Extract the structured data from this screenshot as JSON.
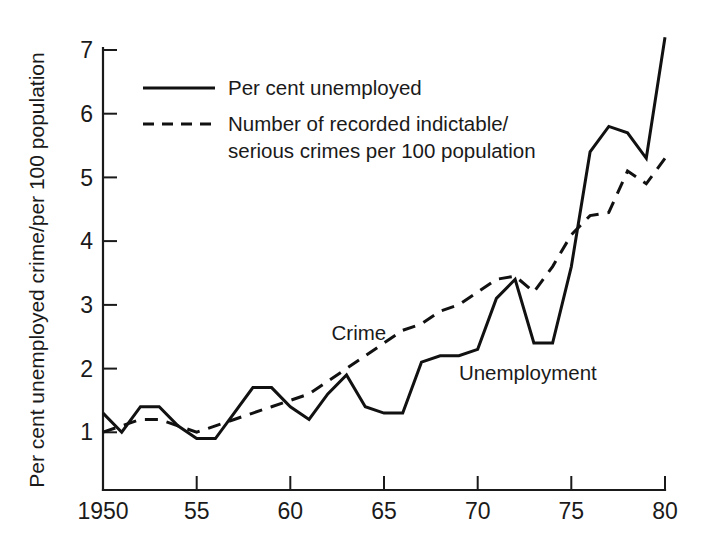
{
  "chart_data": {
    "type": "line",
    "title": "",
    "subtitle": "",
    "xlabel": "",
    "ylabel": "Per cent unemployed crime/per 100 population",
    "xlim": [
      1950,
      1980
    ],
    "ylim": [
      0,
      7
    ],
    "grid": false,
    "legend_position": "top-left",
    "x_tick_labels": [
      "1950",
      "55",
      "60",
      "65",
      "70",
      "75",
      "80"
    ],
    "x_tick_values": [
      1950,
      1955,
      1960,
      1965,
      1970,
      1975,
      1980
    ],
    "y_tick_labels": [
      "1",
      "2",
      "3",
      "4",
      "5",
      "6",
      "7"
    ],
    "y_tick_values": [
      1,
      2,
      3,
      4,
      5,
      6,
      7
    ],
    "x": [
      1950,
      1951,
      1952,
      1953,
      1954,
      1955,
      1956,
      1957,
      1958,
      1959,
      1960,
      1961,
      1962,
      1963,
      1964,
      1965,
      1966,
      1967,
      1968,
      1969,
      1970,
      1971,
      1972,
      1973,
      1974,
      1975,
      1976,
      1977,
      1978,
      1979,
      1980
    ],
    "series": [
      {
        "name": "Per cent unemployed",
        "style": "solid",
        "annotation": "Unemployment",
        "values": [
          1.3,
          1.0,
          1.4,
          1.4,
          1.1,
          0.9,
          0.9,
          1.3,
          1.7,
          1.7,
          1.4,
          1.2,
          1.6,
          1.9,
          1.4,
          1.3,
          1.3,
          2.1,
          2.2,
          2.2,
          2.3,
          3.1,
          3.4,
          2.4,
          2.4,
          3.6,
          5.4,
          5.8,
          5.7,
          5.3,
          7.2
        ]
      },
      {
        "name": "Number of recorded indictable/serious crimes per 100 population",
        "style": "dashed",
        "annotation": "Crime",
        "values": [
          1.0,
          1.1,
          1.2,
          1.2,
          1.1,
          1.0,
          1.1,
          1.2,
          1.3,
          1.4,
          1.5,
          1.6,
          1.8,
          2.0,
          2.2,
          2.4,
          2.6,
          2.7,
          2.9,
          3.0,
          3.2,
          3.4,
          3.45,
          3.2,
          3.6,
          4.1,
          4.4,
          4.45,
          5.1,
          4.9,
          5.3
        ]
      }
    ],
    "legend": [
      {
        "label": "Per cent unemployed",
        "style": "solid"
      },
      {
        "label": "Number of recorded indictable/",
        "label2": "serious crimes per 100 population",
        "style": "dashed"
      }
    ],
    "annotations": [
      {
        "text": "Crime",
        "x": 1962.2,
        "y": 2.45
      },
      {
        "text": "Unemployment",
        "x": 1969.0,
        "y": 1.82
      }
    ]
  },
  "labels": {
    "y_axis_title": "Per cent unemployed crime/per 100 population",
    "legend_solid": "Per cent unemployed",
    "legend_dashed_line1": "Number of recorded indictable/",
    "legend_dashed_line2": "serious crimes per 100 population",
    "annotation_crime": "Crime",
    "annotation_unemployment": "Unemployment",
    "tick_x_1950": "1950",
    "tick_x_1955": "55",
    "tick_x_1960": "60",
    "tick_x_1965": "65",
    "tick_x_1970": "70",
    "tick_x_1975": "75",
    "tick_x_1980": "80",
    "tick_y_1": "1",
    "tick_y_2": "2",
    "tick_y_3": "3",
    "tick_y_4": "4",
    "tick_y_5": "5",
    "tick_y_6": "6",
    "tick_y_7": "7"
  },
  "colors": {
    "ink": "#1a1a1a",
    "background": "#ffffff"
  }
}
